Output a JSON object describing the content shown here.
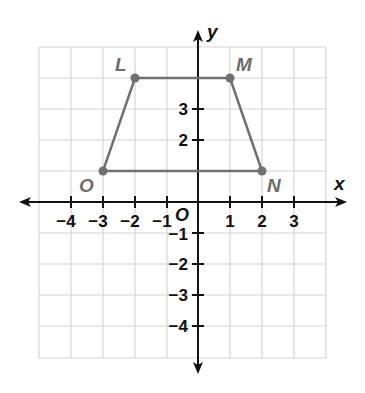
{
  "diagram": {
    "type": "coordinate-plane",
    "grid": {
      "x_min": -5,
      "x_max": 4,
      "y_min": -5,
      "y_max": 5,
      "color": "#d4d4d4"
    },
    "axes": {
      "x_label": "x",
      "y_label": "y",
      "origin_label": "O",
      "color": "#111111"
    },
    "x_ticks": [
      "−4",
      "−3",
      "−2",
      "−1",
      "1",
      "2",
      "3"
    ],
    "y_ticks_positive": [
      "3",
      "2"
    ],
    "y_ticks_negative": [
      "−1",
      "−2",
      "−3",
      "−4"
    ],
    "shape": {
      "name": "trapezoid LMNO",
      "color": "#707070",
      "vertices": [
        {
          "label": "L",
          "x": -2,
          "y": 4
        },
        {
          "label": "M",
          "x": 1,
          "y": 4
        },
        {
          "label": "N",
          "x": 2,
          "y": 1
        },
        {
          "label": "O",
          "x": -3,
          "y": 1
        }
      ]
    }
  }
}
